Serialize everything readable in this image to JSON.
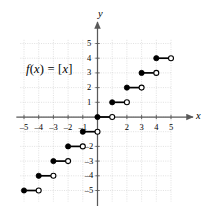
{
  "figure": {
    "function_label_html": "<i>f</i>(<i>x</i>) = [<i>x</i>]",
    "function_label_text": "f(x) = [x]",
    "x_axis_name": "x",
    "y_axis_name": "y"
  },
  "chart_data": {
    "type": "line",
    "title": "",
    "subtitle": "",
    "xlabel": "x",
    "ylabel": "y",
    "function": "f(x) = [x]",
    "function_name": "greatest integer (floor) step function",
    "xlim": [
      -5.25,
      5.0
    ],
    "ylim": [
      -5.75,
      5.25
    ],
    "grid": true,
    "grid_spacing": 1,
    "legend": "none",
    "xticks": [
      -5,
      -4,
      -3,
      -2,
      -1,
      1,
      2,
      3,
      4,
      5
    ],
    "xtick_labels": [
      "-5",
      "-4",
      "-3",
      "-2",
      "-1",
      "1",
      "2",
      "3",
      "4",
      "5"
    ],
    "yticks": [
      -5,
      -4,
      -3,
      -2,
      -1,
      1,
      2,
      3,
      4,
      5
    ],
    "ytick_labels": [
      "-5",
      "-4",
      "-3",
      "-2",
      "-1",
      "1",
      "2",
      "3",
      "4",
      "5"
    ],
    "xticks_visible": [
      -5,
      -4,
      -3,
      -2,
      -1,
      2,
      3,
      4,
      5
    ],
    "yticks_visible": [
      -5,
      -4,
      -3,
      -2,
      1,
      2,
      3,
      4,
      5
    ],
    "steps": [
      {
        "x_start": -5,
        "x_end": -4,
        "y": -5,
        "left_endpoint": "closed",
        "right_endpoint": "open"
      },
      {
        "x_start": -4,
        "x_end": -3,
        "y": -4,
        "left_endpoint": "closed",
        "right_endpoint": "open"
      },
      {
        "x_start": -3,
        "x_end": -2,
        "y": -3,
        "left_endpoint": "closed",
        "right_endpoint": "open"
      },
      {
        "x_start": -2,
        "x_end": -1,
        "y": -2,
        "left_endpoint": "closed",
        "right_endpoint": "open"
      },
      {
        "x_start": -1,
        "x_end": 0,
        "y": -1,
        "left_endpoint": "closed",
        "right_endpoint": "open"
      },
      {
        "x_start": 0,
        "x_end": 1,
        "y": 0,
        "left_endpoint": "closed",
        "right_endpoint": "open"
      },
      {
        "x_start": 1,
        "x_end": 2,
        "y": 1,
        "left_endpoint": "closed",
        "right_endpoint": "open"
      },
      {
        "x_start": 2,
        "x_end": 3,
        "y": 2,
        "left_endpoint": "closed",
        "right_endpoint": "open"
      },
      {
        "x_start": 3,
        "x_end": 4,
        "y": 3,
        "left_endpoint": "closed",
        "right_endpoint": "open"
      },
      {
        "x_start": 4,
        "x_end": 5,
        "y": 4,
        "left_endpoint": "closed",
        "right_endpoint": "open"
      }
    ],
    "colors": {
      "curve": "#000000",
      "axis": "#595959",
      "grid": "#c8c8c8",
      "text": "#000000",
      "background": "#ffffff"
    }
  }
}
